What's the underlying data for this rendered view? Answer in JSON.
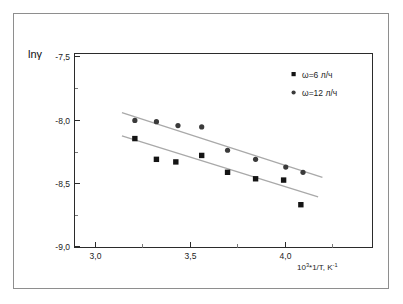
{
  "chart_data": {
    "type": "scatter",
    "title": "",
    "subtitle": "",
    "xlabel": "10³*1/T, K⁻¹",
    "ylabel": "lnγ",
    "xlim": [
      2.82,
      4.2
    ],
    "ylim": [
      -9.0,
      -7.5
    ],
    "xticks": [
      3.0,
      3.5,
      4.0
    ],
    "xtick_labels": [
      "3,0",
      "3,5",
      "4,0"
    ],
    "yticks": [
      -7.5,
      -8.0,
      -8.5,
      -9.0
    ],
    "ytick_labels": [
      "-7,5",
      "-8,0",
      "-8,5",
      "-9,0"
    ],
    "grid": false,
    "legend_position": "top-right",
    "series": [
      {
        "name": "ω=6 л/ч",
        "marker": "square",
        "color": "#141414",
        "points": [
          {
            "x": 3.1,
            "y": -8.16
          },
          {
            "x": 3.2,
            "y": -8.32
          },
          {
            "x": 3.29,
            "y": -8.34
          },
          {
            "x": 3.41,
            "y": -8.29
          },
          {
            "x": 3.53,
            "y": -8.42
          },
          {
            "x": 3.66,
            "y": -8.47
          },
          {
            "x": 3.79,
            "y": -8.48
          },
          {
            "x": 3.87,
            "y": -8.67
          }
        ],
        "fit_line": {
          "x1": 3.04,
          "y1": -8.14,
          "x2": 3.95,
          "y2": -8.61
        }
      },
      {
        "name": "ω=12 л/ч",
        "marker": "circle",
        "color": "#3a3a3a",
        "points": [
          {
            "x": 3.1,
            "y": -8.02
          },
          {
            "x": 3.2,
            "y": -8.03
          },
          {
            "x": 3.3,
            "y": -8.06
          },
          {
            "x": 3.41,
            "y": -8.07
          },
          {
            "x": 3.53,
            "y": -8.25
          },
          {
            "x": 3.66,
            "y": -8.32
          },
          {
            "x": 3.8,
            "y": -8.38
          },
          {
            "x": 3.88,
            "y": -8.42
          }
        ],
        "fit_line": {
          "x1": 3.04,
          "y1": -7.96,
          "x2": 3.97,
          "y2": -8.46
        }
      }
    ]
  },
  "axes": {
    "y_title": "lnγ",
    "x_title_base": "10",
    "x_title_exp": "3",
    "x_title_rest": "*1/T, K",
    "x_title_exp2": "-1"
  },
  "legend": {
    "entries": [
      {
        "label": "ω=6 л/ч",
        "marker": "square"
      },
      {
        "label": "ω=12 л/ч",
        "marker": "circle"
      }
    ]
  }
}
